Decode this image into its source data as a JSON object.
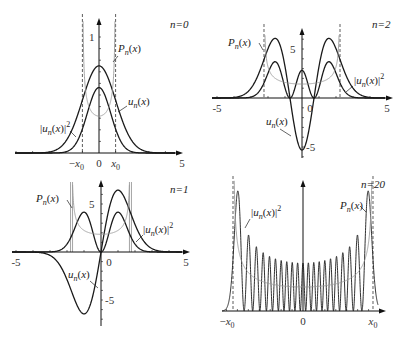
{
  "figure": {
    "width": 405,
    "height": 337,
    "colors": {
      "curve": "#1a1a1a",
      "prob": "#9a9a9a",
      "axis": "#111111",
      "dashed": "#333333"
    }
  },
  "chart_data": [
    {
      "type": "line",
      "panel": "top-left",
      "n": 0,
      "title": "n=0",
      "origin_px": [
        99,
        153
      ],
      "x_px_per_unit": 16.6,
      "y_px_per_unit": 116,
      "xlim": [
        -5,
        5
      ],
      "x_tick_labels": [
        "-x0",
        "0",
        "x0",
        "5"
      ],
      "x_tick_values": [
        -1,
        0,
        1,
        5
      ],
      "y_tick_labels": [
        "1"
      ],
      "y_tick_values": [
        1
      ],
      "y_axis_top_px": 18,
      "x_axis_px": [
        15,
        183
      ],
      "turning_points": [
        -1,
        1
      ],
      "turning_line_style": "dashed",
      "series": [
        {
          "name": "u_n(x)",
          "label": "u",
          "sub": "n",
          "suffix": "(x)",
          "kind": "u"
        },
        {
          "name": "|u_n(x)|^2",
          "label": "|u",
          "sub": "n",
          "suffix": "(x)|",
          "sup": "2",
          "kind": "u2"
        },
        {
          "name": "P_n(x)",
          "label": "P",
          "sub": "n",
          "suffix": "(x)",
          "kind": "P"
        }
      ],
      "labels": [
        {
          "text": "n=0",
          "x": 170,
          "y": 28
        },
        {
          "pos": [
            118,
            52
          ],
          "series": 2,
          "leader": [
            [
              118,
              56
            ],
            [
              113,
              62
            ]
          ]
        },
        {
          "pos": [
            128,
            105
          ],
          "series": 0,
          "leader": [
            [
              127,
              106
            ],
            [
              118,
              112
            ]
          ]
        },
        {
          "pos": [
            40,
            132
          ],
          "series": 1,
          "leader": [
            [
              70,
              131
            ],
            [
              76,
              137
            ]
          ]
        }
      ]
    },
    {
      "type": "line",
      "panel": "top-right",
      "n": 2,
      "title": "n=2",
      "origin_px": [
        302,
        98
      ],
      "x_px_per_unit": 17,
      "y_px_per_unit": 98,
      "xlim": [
        -5,
        5
      ],
      "x_tick_labels": [
        "-5",
        "0",
        "5"
      ],
      "x_tick_values": [
        -5,
        0,
        5
      ],
      "y_tick_labels": [
        "5",
        "-5"
      ],
      "y_tick_values": [
        0.5,
        -0.5
      ],
      "y_axis_top_px": 28,
      "y_axis_bottom_px": 158,
      "x_axis_px": [
        212,
        393
      ],
      "turning_points": [
        -2.236,
        2.236
      ],
      "turning_line_style": "dashed",
      "series": [
        {
          "name": "u_n(x)",
          "kind": "u"
        },
        {
          "name": "|u_n(x)|^2",
          "kind": "u2"
        },
        {
          "name": "P_n(x)",
          "kind": "P"
        }
      ],
      "labels": [
        {
          "text": "n=2",
          "x": 372,
          "y": 28
        },
        {
          "pos": [
            228,
            46
          ],
          "series": 2,
          "leader": [
            [
              259,
              43
            ],
            [
              263,
              50
            ]
          ]
        },
        {
          "pos": [
            354,
            84
          ],
          "series": 1,
          "leader": [
            [
              353,
              86
            ],
            [
              346,
              92
            ]
          ]
        },
        {
          "pos": [
            266,
            125
          ],
          "series": 0,
          "leader": [
            [
              280,
              129
            ],
            [
              291,
              136
            ]
          ]
        }
      ]
    },
    {
      "type": "line",
      "panel": "bottom-left",
      "n": 1,
      "title": "n=1",
      "origin_px": [
        101,
        252
      ],
      "x_px_per_unit": 17,
      "y_px_per_unit": 96,
      "xlim": [
        -5,
        5
      ],
      "x_tick_labels": [
        "-5",
        "0",
        "5"
      ],
      "x_tick_values": [
        -5,
        0,
        5
      ],
      "y_tick_labels": [
        "5",
        "-5"
      ],
      "y_tick_values": [
        0.5,
        -0.5
      ],
      "y_axis_top_px": 180,
      "y_axis_bottom_px": 326,
      "x_axis_px": [
        12,
        190
      ],
      "turning_points": [
        -1.732,
        1.732
      ],
      "turning_line_style": "solid-gray",
      "series": [
        {
          "name": "u_n(x)",
          "kind": "u"
        },
        {
          "name": "|u_n(x)|^2",
          "kind": "u2"
        },
        {
          "name": "P_n(x)",
          "kind": "P"
        }
      ],
      "labels": [
        {
          "text": "n=1",
          "x": 170,
          "y": 193
        },
        {
          "pos": [
            36,
            202
          ],
          "series": 2,
          "leader": [
            [
              67,
              200
            ],
            [
              72,
              208
            ]
          ]
        },
        {
          "pos": [
            143,
            233
          ],
          "series": 1,
          "leader": [
            [
              143,
              235
            ],
            [
              136,
              242
            ]
          ]
        },
        {
          "pos": [
            68,
            278
          ],
          "series": 0,
          "leader": [
            [
              90,
              281
            ],
            [
              98,
              288
            ]
          ]
        }
      ]
    },
    {
      "type": "line",
      "panel": "bottom-right",
      "n": 20,
      "title": "n=20",
      "origin_px": [
        303,
        311
      ],
      "x_px_per_unit": 10.93,
      "y_px_per_unit": 483,
      "xlim": [
        -7,
        7
      ],
      "x_tick_labels": [
        "-x0",
        "0",
        "x0"
      ],
      "x_tick_values": [
        -6.403,
        0,
        6.403
      ],
      "y_tick_labels": [],
      "y_tick_values": [],
      "y_axis_top_px": 180,
      "x_axis_px": [
        222,
        386
      ],
      "turning_points": [
        -6.403,
        6.403
      ],
      "turning_line_style": "dashed",
      "series": [
        {
          "name": "|u_n(x)|^2",
          "kind": "u2"
        },
        {
          "name": "P_n(x)",
          "kind": "P"
        }
      ],
      "labels": [
        {
          "text": "n=20",
          "x": 361,
          "y": 188
        },
        {
          "pos": [
            340,
            209
          ],
          "series": 1,
          "leader": [
            [
              360,
              206
            ],
            [
              366,
              212
            ]
          ]
        },
        {
          "pos": [
            251,
            216
          ],
          "series": 0,
          "leader": [
            [
              250,
              219
            ],
            [
              245,
              228
            ]
          ]
        }
      ]
    }
  ]
}
